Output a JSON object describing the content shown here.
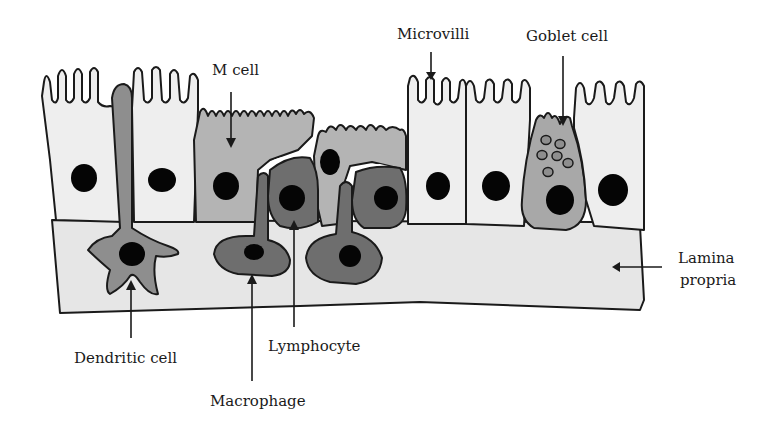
{
  "figure": {
    "colors": {
      "outline": "#1a1a1a",
      "enterocyte_fill": "#eeeeee",
      "lamina_fill": "#e6e6e6",
      "m_cell_fill": "#b4b4b4",
      "goblet_fill": "#a8a8a8",
      "dendritic_fill": "#8e8e8e",
      "immune_dark_fill": "#6e6e6e",
      "nucleus": "#050505",
      "background": "#ffffff"
    },
    "labels": {
      "m_cell": "M cell",
      "microvilli": "Microvilli",
      "goblet_cell": "Goblet cell",
      "lamina_propria_line1": "Lamina",
      "lamina_propria_line2": "propria",
      "dendritic_cell": "Dendritic cell",
      "lymphocyte": "Lymphocyte",
      "macrophage": "Macrophage"
    }
  }
}
